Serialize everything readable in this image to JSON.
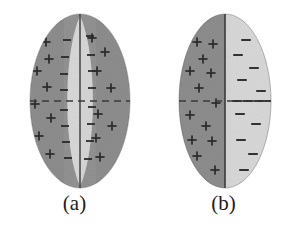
{
  "figure": {
    "background_color": "#ffffff",
    "width": 298,
    "height": 232,
    "panel_count": 2
  },
  "colors": {
    "dark_gray_fill": "#8e8e8e",
    "light_gray_fill": "#d9d9d9",
    "mid_gray_fill": "#b4b4b4",
    "outline_color": "#4a4a4a",
    "center_line_color": "#3a3a3a",
    "dashed_line_color": "#3a3a3a",
    "sign_color": "#2b2b2b",
    "caption_color": "#1c1c1c",
    "background": "#ffffff"
  },
  "panels": [
    {
      "id": "a",
      "caption": "(a)",
      "description": "Ellipse with dark outer lobes carrying positive charge and a lens-shaped light central band carrying negative charge",
      "ellipse": {
        "center_x": 80,
        "center_y": 101,
        "radius_x": 50,
        "radius_y": 87
      },
      "center_line": {
        "label": "vertical-center-line",
        "x": 80,
        "y_top": 14,
        "y_bottom": 188
      },
      "dashed_line": {
        "label": "horizontal-dashed-midline",
        "y": 101,
        "x_left": 30,
        "x_right": 130,
        "dash": "7 5"
      },
      "regions": [
        {
          "name": "left-outer-region",
          "fill": "#8e8e8e",
          "sign": "+"
        },
        {
          "name": "left-inner-band",
          "fill": "#d9d9d9",
          "sign": "-"
        },
        {
          "name": "right-inner-band",
          "fill": "#cfcfcf",
          "sign": "-"
        },
        {
          "name": "right-outer-region",
          "fill": "#8e8e8e",
          "sign": "+"
        }
      ],
      "plus_marks": [
        {
          "x": 46,
          "y": 42
        },
        {
          "x": 49,
          "y": 59
        },
        {
          "x": 37,
          "y": 71
        },
        {
          "x": 47,
          "y": 87
        },
        {
          "x": 35,
          "y": 104
        },
        {
          "x": 51,
          "y": 118
        },
        {
          "x": 39,
          "y": 136
        },
        {
          "x": 50,
          "y": 154
        },
        {
          "x": 92,
          "y": 38
        },
        {
          "x": 105,
          "y": 52
        },
        {
          "x": 97,
          "y": 71
        },
        {
          "x": 111,
          "y": 88
        },
        {
          "x": 98,
          "y": 114
        },
        {
          "x": 112,
          "y": 126
        },
        {
          "x": 96,
          "y": 138
        },
        {
          "x": 100,
          "y": 157
        }
      ],
      "minus_marks": [
        {
          "x": 67,
          "y": 40
        },
        {
          "x": 65,
          "y": 57
        },
        {
          "x": 64,
          "y": 74
        },
        {
          "x": 64,
          "y": 90
        },
        {
          "x": 64,
          "y": 110
        },
        {
          "x": 65,
          "y": 126
        },
        {
          "x": 66,
          "y": 142
        },
        {
          "x": 68,
          "y": 158
        },
        {
          "x": 90,
          "y": 36
        },
        {
          "x": 91,
          "y": 55
        },
        {
          "x": 92,
          "y": 71
        },
        {
          "x": 92,
          "y": 88
        },
        {
          "x": 92,
          "y": 107
        },
        {
          "x": 91,
          "y": 124
        },
        {
          "x": 90,
          "y": 141
        },
        {
          "x": 88,
          "y": 159
        }
      ]
    },
    {
      "id": "b",
      "caption": "(b)",
      "description": "Ellipse split vertically into a dark positive left half and a light negative right half",
      "ellipse": {
        "center_x": 76,
        "center_y": 101,
        "radius_x": 46,
        "radius_y": 87
      },
      "center_line": {
        "label": "vertical-divider-line",
        "x": 76,
        "y_top": 14,
        "y_bottom": 188
      },
      "dashed_line": {
        "label": "horizontal-dashed-midline",
        "y": 101,
        "x_left": 30,
        "x_right": 122,
        "dash": "7 5"
      },
      "regions": [
        {
          "name": "left-half-positive",
          "fill": "#8e8e8e",
          "sign": "+"
        },
        {
          "name": "right-half-negative",
          "fill": "#d9d9d9",
          "sign": "-"
        }
      ],
      "plus_marks": [
        {
          "x": 48,
          "y": 42
        },
        {
          "x": 64,
          "y": 44
        },
        {
          "x": 54,
          "y": 59
        },
        {
          "x": 41,
          "y": 71
        },
        {
          "x": 62,
          "y": 73
        },
        {
          "x": 50,
          "y": 88
        },
        {
          "x": 67,
          "y": 103
        },
        {
          "x": 41,
          "y": 115
        },
        {
          "x": 57,
          "y": 126
        },
        {
          "x": 43,
          "y": 140
        },
        {
          "x": 63,
          "y": 141
        },
        {
          "x": 48,
          "y": 156
        },
        {
          "x": 66,
          "y": 170
        }
      ],
      "minus_marks": [
        {
          "x": 97,
          "y": 40
        },
        {
          "x": 89,
          "y": 55
        },
        {
          "x": 105,
          "y": 68
        },
        {
          "x": 93,
          "y": 80
        },
        {
          "x": 112,
          "y": 91
        },
        {
          "x": 88,
          "y": 101
        },
        {
          "x": 99,
          "y": 101
        },
        {
          "x": 110,
          "y": 101
        },
        {
          "x": 120,
          "y": 101
        },
        {
          "x": 91,
          "y": 114
        },
        {
          "x": 107,
          "y": 124
        },
        {
          "x": 92,
          "y": 140
        },
        {
          "x": 104,
          "y": 154
        },
        {
          "x": 95,
          "y": 170
        }
      ]
    }
  ]
}
